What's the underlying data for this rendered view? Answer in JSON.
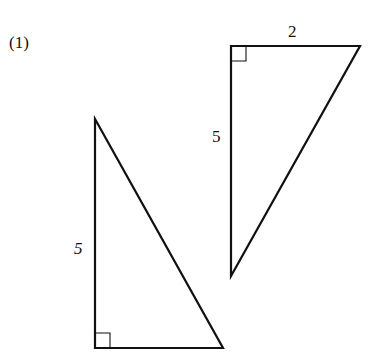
{
  "problem": {
    "number_label": "(1)"
  },
  "figures": [
    {
      "id": "triangle-top-right",
      "type": "right-triangle",
      "right_angle_at": "top-left",
      "labels": {
        "vertical_leg": "5",
        "horizontal_leg": "2"
      }
    },
    {
      "id": "triangle-bottom-left",
      "type": "right-triangle",
      "right_angle_at": "bottom-left",
      "labels": {
        "vertical_leg": "5"
      }
    }
  ],
  "colors": {
    "stroke": "#111111",
    "background": "#ffffff"
  }
}
